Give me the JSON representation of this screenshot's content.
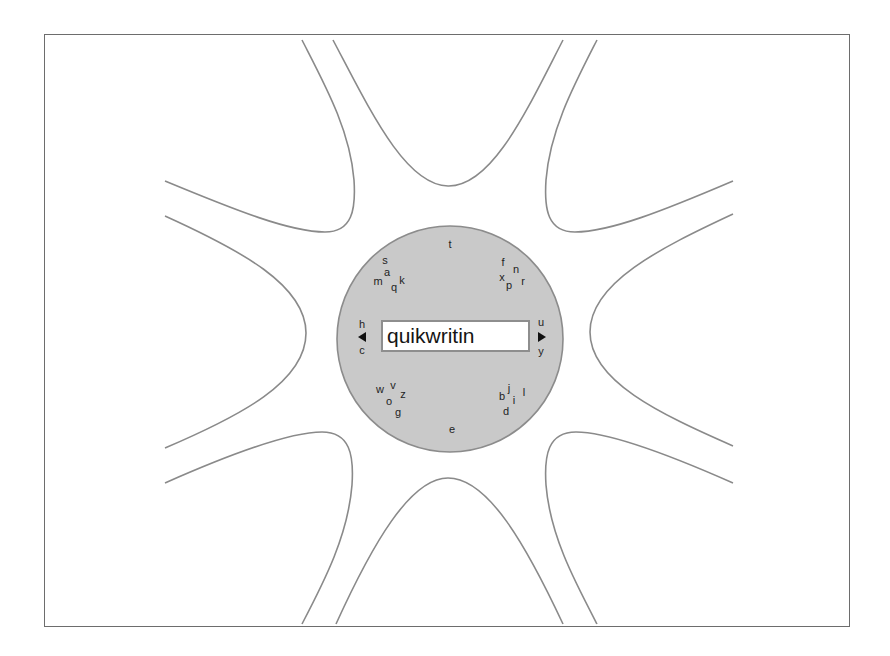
{
  "app": {
    "name": "Quikwriting text entry"
  },
  "input": {
    "text": "quikwritin"
  },
  "colors": {
    "center_fill": "#c9c9c9",
    "curve_stroke": "#8a8a8a",
    "frame_border": "#6d6d6d"
  },
  "zones": {
    "top": {
      "letters": [
        {
          "ch": "t",
          "x": 450,
          "y": 244
        }
      ]
    },
    "top_left": {
      "letters": [
        {
          "ch": "s",
          "x": 385,
          "y": 260
        },
        {
          "ch": "a",
          "x": 387,
          "y": 272
        },
        {
          "ch": "m",
          "x": 378,
          "y": 281
        },
        {
          "ch": "q",
          "x": 394,
          "y": 287
        },
        {
          "ch": "k",
          "x": 402,
          "y": 280
        }
      ]
    },
    "top_right": {
      "letters": [
        {
          "ch": "f",
          "x": 503,
          "y": 262
        },
        {
          "ch": "n",
          "x": 516,
          "y": 269
        },
        {
          "ch": "x",
          "x": 502,
          "y": 277
        },
        {
          "ch": "p",
          "x": 509,
          "y": 285
        },
        {
          "ch": "r",
          "x": 523,
          "y": 281
        }
      ]
    },
    "left": {
      "letters": [
        {
          "ch": "h",
          "x": 362,
          "y": 324
        },
        {
          "ch": "c",
          "x": 362,
          "y": 350
        }
      ],
      "arrow": "left"
    },
    "right": {
      "letters": [
        {
          "ch": "u",
          "x": 541,
          "y": 322
        },
        {
          "ch": "y",
          "x": 541,
          "y": 351
        }
      ],
      "arrow": "right"
    },
    "bottom_left": {
      "letters": [
        {
          "ch": "w",
          "x": 380,
          "y": 389
        },
        {
          "ch": "v",
          "x": 393,
          "y": 385
        },
        {
          "ch": "z",
          "x": 403,
          "y": 394
        },
        {
          "ch": "o",
          "x": 389,
          "y": 401
        },
        {
          "ch": "g",
          "x": 398,
          "y": 412
        }
      ]
    },
    "bottom_right": {
      "letters": [
        {
          "ch": "b",
          "x": 502,
          "y": 396
        },
        {
          "ch": "j",
          "x": 509,
          "y": 388
        },
        {
          "ch": "i",
          "x": 514,
          "y": 400
        },
        {
          "ch": "l",
          "x": 524,
          "y": 392
        },
        {
          "ch": "d",
          "x": 506,
          "y": 411
        }
      ]
    },
    "bottom": {
      "letters": [
        {
          "ch": "e",
          "x": 452,
          "y": 429
        }
      ]
    }
  }
}
